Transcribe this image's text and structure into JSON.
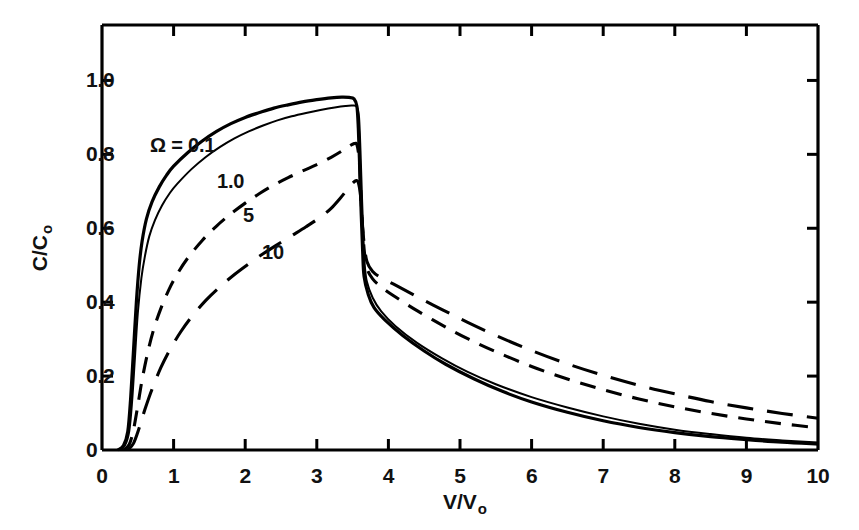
{
  "chart_data": {
    "type": "line",
    "title": "",
    "xlabel": "V/V o",
    "ylabel": "C/C o",
    "xlim": [
      0,
      10
    ],
    "ylim": [
      0,
      1.15
    ],
    "grid": false,
    "legend_position": "inline-annotations",
    "x_ticks": [
      "0",
      "1",
      "2",
      "3",
      "4",
      "5",
      "6",
      "7",
      "8",
      "9",
      "10"
    ],
    "x_tick_values": [
      0,
      1,
      2,
      3,
      4,
      5,
      6,
      7,
      8,
      9,
      10
    ],
    "y_ticks": [
      "0",
      "0.2",
      "0.4",
      "0.6",
      "0.8",
      "1.0"
    ],
    "y_tick_values": [
      0,
      0.2,
      0.4,
      0.6,
      0.8,
      1.0
    ],
    "annotations": [
      {
        "text": "Ω = 0.1",
        "x_px": 150,
        "y_px": 134,
        "series": "0.1"
      },
      {
        "text": "1.0",
        "x_px": 217,
        "y_px": 170,
        "series": "1.0"
      },
      {
        "text": "5",
        "x_px": 243,
        "y_px": 204,
        "series": "5"
      },
      {
        "text": "10",
        "x_px": 262,
        "y_px": 241,
        "series": "10"
      }
    ],
    "series": [
      {
        "name": "0.1",
        "label": "Ω = 0.1",
        "style": "solid",
        "stroke_width": 3.2,
        "color": "#000000",
        "points": [
          [
            0.22,
            0.0
          ],
          [
            0.3,
            0.012
          ],
          [
            0.36,
            0.05
          ],
          [
            0.4,
            0.14
          ],
          [
            0.44,
            0.27
          ],
          [
            0.48,
            0.4
          ],
          [
            0.52,
            0.5
          ],
          [
            0.56,
            0.565
          ],
          [
            0.62,
            0.625
          ],
          [
            0.7,
            0.672
          ],
          [
            0.8,
            0.712
          ],
          [
            0.9,
            0.743
          ],
          [
            1.0,
            0.768
          ],
          [
            1.2,
            0.805
          ],
          [
            1.4,
            0.836
          ],
          [
            1.6,
            0.862
          ],
          [
            1.8,
            0.883
          ],
          [
            2.0,
            0.9
          ],
          [
            2.2,
            0.913
          ],
          [
            2.4,
            0.925
          ],
          [
            2.6,
            0.934
          ],
          [
            2.8,
            0.942
          ],
          [
            3.0,
            0.948
          ],
          [
            3.2,
            0.953
          ],
          [
            3.35,
            0.955
          ],
          [
            3.45,
            0.954
          ],
          [
            3.52,
            0.95
          ],
          [
            3.56,
            0.93
          ],
          [
            3.58,
            0.87
          ],
          [
            3.6,
            0.76
          ],
          [
            3.62,
            0.64
          ],
          [
            3.64,
            0.54
          ],
          [
            3.66,
            0.47
          ],
          [
            3.72,
            0.42
          ],
          [
            3.8,
            0.385
          ],
          [
            3.95,
            0.352
          ],
          [
            4.2,
            0.31
          ],
          [
            4.5,
            0.268
          ],
          [
            4.8,
            0.232
          ],
          [
            5.2,
            0.192
          ],
          [
            5.6,
            0.158
          ],
          [
            6.0,
            0.13
          ],
          [
            6.5,
            0.102
          ],
          [
            7.0,
            0.079
          ],
          [
            7.5,
            0.061
          ],
          [
            8.0,
            0.047
          ],
          [
            8.5,
            0.036
          ],
          [
            9.0,
            0.028
          ],
          [
            9.5,
            0.021
          ],
          [
            10.0,
            0.016
          ]
        ]
      },
      {
        "name": "1.0",
        "label": "1.0",
        "style": "solid",
        "stroke_width": 2.0,
        "color": "#000000",
        "points": [
          [
            0.24,
            0.0
          ],
          [
            0.32,
            0.012
          ],
          [
            0.38,
            0.05
          ],
          [
            0.42,
            0.13
          ],
          [
            0.46,
            0.25
          ],
          [
            0.5,
            0.37
          ],
          [
            0.55,
            0.465
          ],
          [
            0.6,
            0.525
          ],
          [
            0.66,
            0.578
          ],
          [
            0.74,
            0.622
          ],
          [
            0.84,
            0.662
          ],
          [
            0.95,
            0.696
          ],
          [
            1.05,
            0.72
          ],
          [
            1.25,
            0.76
          ],
          [
            1.45,
            0.793
          ],
          [
            1.65,
            0.82
          ],
          [
            1.85,
            0.843
          ],
          [
            2.05,
            0.862
          ],
          [
            2.25,
            0.878
          ],
          [
            2.45,
            0.892
          ],
          [
            2.65,
            0.903
          ],
          [
            2.85,
            0.912
          ],
          [
            3.05,
            0.92
          ],
          [
            3.25,
            0.927
          ],
          [
            3.4,
            0.931
          ],
          [
            3.5,
            0.932
          ],
          [
            3.56,
            0.928
          ],
          [
            3.59,
            0.9
          ],
          [
            3.61,
            0.81
          ],
          [
            3.63,
            0.69
          ],
          [
            3.65,
            0.58
          ],
          [
            3.67,
            0.5
          ],
          [
            3.7,
            0.455
          ],
          [
            3.78,
            0.412
          ],
          [
            3.9,
            0.375
          ],
          [
            4.1,
            0.335
          ],
          [
            4.4,
            0.29
          ],
          [
            4.75,
            0.248
          ],
          [
            5.1,
            0.212
          ],
          [
            5.5,
            0.178
          ],
          [
            6.0,
            0.143
          ],
          [
            6.5,
            0.115
          ],
          [
            7.0,
            0.091
          ],
          [
            7.5,
            0.071
          ],
          [
            8.0,
            0.055
          ],
          [
            8.5,
            0.043
          ],
          [
            9.0,
            0.033
          ],
          [
            9.5,
            0.026
          ],
          [
            10.0,
            0.02
          ]
        ]
      },
      {
        "name": "5",
        "label": "5",
        "style": "dashed-short",
        "dash": "16,11",
        "stroke_width": 3.1,
        "color": "#000000",
        "points": [
          [
            0.3,
            0.0
          ],
          [
            0.38,
            0.015
          ],
          [
            0.44,
            0.055
          ],
          [
            0.5,
            0.12
          ],
          [
            0.56,
            0.19
          ],
          [
            0.64,
            0.265
          ],
          [
            0.72,
            0.325
          ],
          [
            0.82,
            0.382
          ],
          [
            0.94,
            0.436
          ],
          [
            1.06,
            0.479
          ],
          [
            1.2,
            0.52
          ],
          [
            1.4,
            0.567
          ],
          [
            1.6,
            0.606
          ],
          [
            1.8,
            0.639
          ],
          [
            2.0,
            0.668
          ],
          [
            2.2,
            0.694
          ],
          [
            2.4,
            0.717
          ],
          [
            2.6,
            0.737
          ],
          [
            2.8,
            0.755
          ],
          [
            3.0,
            0.772
          ],
          [
            3.2,
            0.792
          ],
          [
            3.35,
            0.809
          ],
          [
            3.45,
            0.822
          ],
          [
            3.52,
            0.829
          ],
          [
            3.56,
            0.826
          ],
          [
            3.59,
            0.79
          ],
          [
            3.61,
            0.72
          ],
          [
            3.63,
            0.63
          ],
          [
            3.66,
            0.545
          ],
          [
            3.7,
            0.492
          ],
          [
            3.78,
            0.463
          ],
          [
            3.9,
            0.441
          ],
          [
            4.1,
            0.414
          ],
          [
            4.4,
            0.377
          ],
          [
            4.75,
            0.338
          ],
          [
            5.1,
            0.302
          ],
          [
            5.5,
            0.266
          ],
          [
            6.0,
            0.226
          ],
          [
            6.5,
            0.192
          ],
          [
            7.0,
            0.163
          ],
          [
            7.5,
            0.138
          ],
          [
            8.0,
            0.117
          ],
          [
            8.5,
            0.099
          ],
          [
            9.0,
            0.084
          ],
          [
            9.5,
            0.071
          ],
          [
            10.0,
            0.06
          ]
        ]
      },
      {
        "name": "10",
        "label": "10",
        "style": "dashed-long",
        "dash": "26,14",
        "stroke_width": 3.1,
        "color": "#000000",
        "points": [
          [
            0.36,
            0.0
          ],
          [
            0.44,
            0.018
          ],
          [
            0.52,
            0.06
          ],
          [
            0.6,
            0.11
          ],
          [
            0.7,
            0.165
          ],
          [
            0.82,
            0.222
          ],
          [
            0.95,
            0.272
          ],
          [
            1.1,
            0.32
          ],
          [
            1.25,
            0.36
          ],
          [
            1.45,
            0.405
          ],
          [
            1.65,
            0.442
          ],
          [
            1.85,
            0.475
          ],
          [
            2.05,
            0.504
          ],
          [
            2.25,
            0.531
          ],
          [
            2.45,
            0.556
          ],
          [
            2.65,
            0.58
          ],
          [
            2.85,
            0.604
          ],
          [
            3.05,
            0.63
          ],
          [
            3.2,
            0.654
          ],
          [
            3.33,
            0.682
          ],
          [
            3.43,
            0.706
          ],
          [
            3.5,
            0.722
          ],
          [
            3.55,
            0.729
          ],
          [
            3.58,
            0.724
          ],
          [
            3.61,
            0.69
          ],
          [
            3.63,
            0.63
          ],
          [
            3.66,
            0.56
          ],
          [
            3.7,
            0.51
          ],
          [
            3.78,
            0.483
          ],
          [
            3.9,
            0.466
          ],
          [
            4.1,
            0.446
          ],
          [
            4.4,
            0.415
          ],
          [
            4.75,
            0.38
          ],
          [
            5.1,
            0.346
          ],
          [
            5.5,
            0.31
          ],
          [
            6.0,
            0.269
          ],
          [
            6.5,
            0.233
          ],
          [
            7.0,
            0.202
          ],
          [
            7.5,
            0.175
          ],
          [
            8.0,
            0.152
          ],
          [
            8.5,
            0.131
          ],
          [
            9.0,
            0.114
          ],
          [
            9.5,
            0.099
          ],
          [
            10.0,
            0.086
          ]
        ]
      }
    ]
  },
  "axes": {
    "x_title_main": "V/V",
    "x_title_sub": "o",
    "y_title_main": "C/C",
    "y_title_sub": "o"
  },
  "colors": {
    "ink": "#000000",
    "background": "#ffffff"
  }
}
